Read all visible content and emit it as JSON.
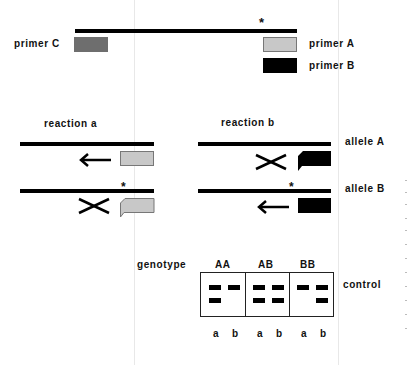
{
  "diagram": {
    "type": "ARMS PCR allele-specific primer diagram",
    "template": {
      "mutation_marker": "*"
    },
    "primers": {
      "C": {
        "label": "primer C",
        "color": "#6e6e6e"
      },
      "A": {
        "label": "primer A",
        "color": "#c8c8c8"
      },
      "B": {
        "label": "primer B",
        "color": "#000000"
      }
    },
    "reactions": [
      {
        "label": "reaction a",
        "primer": "A"
      },
      {
        "label": "reaction b",
        "primer": "B"
      }
    ],
    "alleles": [
      {
        "label": "allele A"
      },
      {
        "label": "allele B"
      }
    ],
    "gel": {
      "genotype_label": "genotype",
      "control_label": "control",
      "genotypes": [
        {
          "name": "AA",
          "lanes": [
            {
              "lane": "a",
              "bands": [
                "control",
                "product"
              ]
            },
            {
              "lane": "b",
              "bands": [
                "control"
              ]
            }
          ]
        },
        {
          "name": "AB",
          "lanes": [
            {
              "lane": "a",
              "bands": [
                "control",
                "product"
              ]
            },
            {
              "lane": "b",
              "bands": [
                "control",
                "product"
              ]
            }
          ]
        },
        {
          "name": "BB",
          "lanes": [
            {
              "lane": "a",
              "bands": [
                "control"
              ]
            },
            {
              "lane": "b",
              "bands": [
                "control",
                "product"
              ]
            }
          ]
        }
      ],
      "lane_labels": [
        "a",
        "b",
        "a",
        "b",
        "a",
        "b"
      ]
    }
  }
}
